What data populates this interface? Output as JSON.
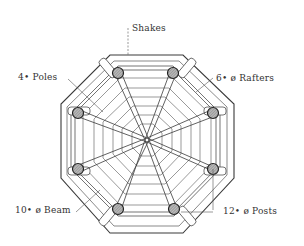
{
  "diagram": {
    "type": "octagonal gazebo roof framing plan",
    "colors": {
      "ink": "#3a3a3a",
      "post_fill": "#9a9a9a",
      "background": "#ffffff"
    },
    "center": [
      147,
      140
    ],
    "labels": {
      "shakes": "Shakes",
      "poles": "4• Poles",
      "rafters": "6• ø Rafters",
      "beam": "10• ø Beam",
      "posts": "12• ø Posts"
    },
    "posts": [
      [
        118,
        73
      ],
      [
        173,
        73
      ],
      [
        213,
        113
      ],
      [
        213,
        169
      ],
      [
        174,
        209
      ],
      [
        118,
        209
      ],
      [
        78,
        169
      ],
      [
        78,
        113
      ]
    ]
  }
}
